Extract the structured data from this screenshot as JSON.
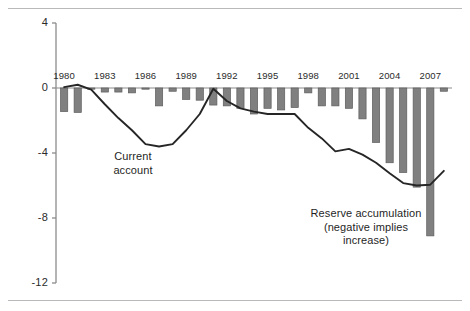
{
  "figure": {
    "background": "#ffffff",
    "rule_color": "#b9b9b9",
    "has_top_rule": true,
    "has_bottom_rule": true
  },
  "annotations": {
    "current_account": "Current\naccount",
    "current_account_line1": "Current",
    "current_account_line2": "account",
    "reserve_line1": "Reserve accumulation",
    "reserve_line2": "(negative implies",
    "reserve_line3": "increase)"
  },
  "colors": {
    "bar": "#808080",
    "bar_edge": "#5c5c5c",
    "line": "#262626",
    "axis": "#8c8c8c",
    "zero_line": "#8c8c8c",
    "text": "#2b2b2b"
  },
  "chart_data": {
    "type": "bar",
    "title": "",
    "xlabel": "",
    "ylabel": "",
    "ylim": [
      -12,
      4
    ],
    "yticks": [
      4,
      0,
      -4,
      -8,
      -12
    ],
    "ytick_labels": [
      "4",
      "0",
      "-4",
      "-8",
      "-12"
    ],
    "xlim": [
      1979.4,
      2008.6
    ],
    "xticks": [
      1980,
      1983,
      1986,
      1989,
      1992,
      1995,
      1998,
      2001,
      2004,
      2007
    ],
    "xtick_labels": [
      "1980",
      "1983",
      "1986",
      "1989",
      "1992",
      "1995",
      "1998",
      "2001",
      "2004",
      "2007"
    ],
    "grid": false,
    "legend": "none",
    "x": [
      1980,
      1981,
      1982,
      1983,
      1984,
      1985,
      1986,
      1987,
      1988,
      1989,
      1990,
      1991,
      1992,
      1993,
      1994,
      1995,
      1996,
      1997,
      1998,
      1999,
      2000,
      2001,
      2002,
      2003,
      2004,
      2005,
      2006,
      2007,
      2008
    ],
    "series": [
      {
        "name": "Reserve accumulation (negative implies increase)",
        "type": "bar",
        "color": "#808080",
        "values": [
          -1.45,
          -1.5,
          -0.05,
          -0.25,
          -0.25,
          -0.3,
          -0.05,
          -1.1,
          -0.2,
          -0.7,
          -0.75,
          -1.05,
          -1.1,
          -1.25,
          -1.6,
          -1.25,
          -1.35,
          -1.2,
          -0.3,
          -1.1,
          -1.1,
          -1.25,
          -1.9,
          -3.35,
          -4.6,
          -5.2,
          -6.1,
          -9.1,
          -0.2
        ]
      },
      {
        "name": "Current account",
        "type": "line",
        "color": "#262626",
        "values": [
          0.05,
          0.2,
          -0.1,
          -1.0,
          -1.85,
          -2.6,
          -3.45,
          -3.6,
          -3.45,
          -2.6,
          -1.6,
          -0.05,
          -0.8,
          -1.25,
          -1.45,
          -1.6,
          -1.6,
          -1.6,
          -2.45,
          -3.1,
          -3.9,
          -3.75,
          -4.1,
          -4.6,
          -5.25,
          -5.85,
          -6.0,
          -5.95,
          -5.1
        ]
      }
    ]
  }
}
